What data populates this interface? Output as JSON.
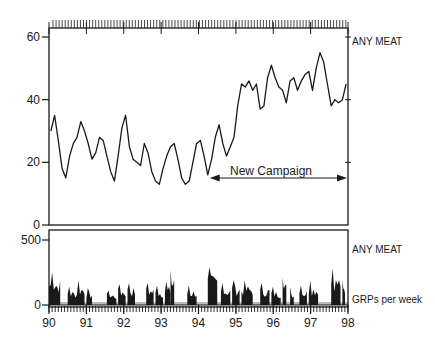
{
  "chart_data": [
    {
      "type": "line",
      "panel": "top",
      "title": "",
      "xlabel": "",
      "ylabel": "",
      "series_label": "ANY MEAT",
      "ylim": [
        0,
        63
      ],
      "yticks": [
        0,
        20,
        40,
        60
      ],
      "xlim": [
        1990,
        1998
      ],
      "annotation": {
        "text": "New Campaign",
        "arrow_from": 1994.3,
        "arrow_to": 1998,
        "y": 15
      },
      "x": [
        1990.05,
        1990.15,
        1990.25,
        1990.35,
        1990.45,
        1990.55,
        1990.65,
        1990.75,
        1990.85,
        1990.95,
        1991.05,
        1991.15,
        1991.25,
        1991.35,
        1991.45,
        1991.55,
        1991.65,
        1991.75,
        1991.85,
        1991.95,
        1992.05,
        1992.15,
        1992.25,
        1992.35,
        1992.45,
        1992.55,
        1992.65,
        1992.75,
        1992.85,
        1992.95,
        1993.05,
        1993.15,
        1993.25,
        1993.35,
        1993.45,
        1993.55,
        1993.65,
        1993.75,
        1993.85,
        1993.95,
        1994.05,
        1994.15,
        1994.25,
        1994.35,
        1994.45,
        1994.55,
        1994.65,
        1994.75,
        1994.85,
        1994.95,
        1995.05,
        1995.15,
        1995.25,
        1995.35,
        1995.45,
        1995.55,
        1995.65,
        1995.75,
        1995.85,
        1995.95,
        1996.05,
        1996.15,
        1996.25,
        1996.35,
        1996.45,
        1996.55,
        1996.65,
        1996.75,
        1996.85,
        1996.95,
        1997.05,
        1997.15,
        1997.25,
        1997.35,
        1997.45,
        1997.55,
        1997.65,
        1997.75,
        1997.85,
        1997.95
      ],
      "values": [
        30,
        35,
        27,
        18,
        15,
        22,
        26,
        28,
        33,
        30,
        26,
        21,
        23,
        28,
        27,
        22,
        17,
        14,
        22,
        31,
        35,
        25,
        21,
        20,
        19,
        26,
        23,
        17,
        14,
        13,
        18,
        22,
        25,
        26,
        21,
        15,
        13,
        14,
        20,
        26,
        27,
        22,
        16,
        21,
        28,
        32,
        26,
        22,
        25,
        28,
        38,
        45,
        44,
        46,
        43,
        45,
        37,
        38,
        47,
        51,
        47,
        44,
        43,
        39,
        46,
        47,
        43,
        46,
        48,
        49,
        43,
        50,
        55,
        52,
        45,
        38,
        40,
        39,
        40,
        45
      ],
      "color": "#1a1a1a"
    },
    {
      "type": "bar",
      "panel": "bottom",
      "series_label": "ANY MEAT",
      "ylabel": "GRPs per week",
      "ylim": [
        0,
        500
      ],
      "yticks": [
        0,
        500
      ],
      "xlim": [
        1990,
        1998
      ],
      "xticks": [
        "90",
        "91",
        "92",
        "93",
        "94",
        "95",
        "96",
        "97",
        "98"
      ],
      "bursts": [
        {
          "start": 1990.0,
          "end": 1990.3,
          "peak": 250
        },
        {
          "start": 1990.5,
          "end": 1990.75,
          "peak": 140
        },
        {
          "start": 1990.75,
          "end": 1990.95,
          "peak": 190
        },
        {
          "start": 1991.0,
          "end": 1991.15,
          "peak": 130
        },
        {
          "start": 1991.55,
          "end": 1991.8,
          "peak": 110
        },
        {
          "start": 1991.85,
          "end": 1992.05,
          "peak": 160
        },
        {
          "start": 1992.1,
          "end": 1992.3,
          "peak": 170
        },
        {
          "start": 1992.6,
          "end": 1992.8,
          "peak": 170
        },
        {
          "start": 1992.85,
          "end": 1993.05,
          "peak": 150
        },
        {
          "start": 1993.1,
          "end": 1993.25,
          "peak": 180
        },
        {
          "start": 1993.25,
          "end": 1993.35,
          "peak": 270
        },
        {
          "start": 1993.7,
          "end": 1993.95,
          "peak": 150
        },
        {
          "start": 1994.25,
          "end": 1994.5,
          "peak": 290
        },
        {
          "start": 1994.6,
          "end": 1994.85,
          "peak": 170
        },
        {
          "start": 1994.9,
          "end": 1995.1,
          "peak": 190
        },
        {
          "start": 1995.15,
          "end": 1995.45,
          "peak": 190
        },
        {
          "start": 1995.65,
          "end": 1995.9,
          "peak": 170
        },
        {
          "start": 1995.95,
          "end": 1996.2,
          "peak": 140
        },
        {
          "start": 1996.25,
          "end": 1996.35,
          "peak": 210
        },
        {
          "start": 1996.45,
          "end": 1996.55,
          "peak": 140
        },
        {
          "start": 1996.7,
          "end": 1996.9,
          "peak": 150
        },
        {
          "start": 1996.95,
          "end": 1997.2,
          "peak": 190
        },
        {
          "start": 1997.55,
          "end": 1997.8,
          "peak": 280
        },
        {
          "start": 1997.85,
          "end": 1997.92,
          "peak": 190
        }
      ],
      "color": "#1a1a1a"
    }
  ],
  "labels": {
    "top_series": "ANY MEAT",
    "bottom_series": "ANY MEAT",
    "bottom_unit": "GRPs per week",
    "annotation": "New Campaign",
    "y_top_ticks": [
      "60",
      "40",
      "20",
      "0"
    ],
    "y_bottom_ticks": [
      "500",
      "0"
    ],
    "x_ticks": [
      "90",
      "91",
      "92",
      "93",
      "94",
      "95",
      "96",
      "97",
      "98"
    ]
  }
}
